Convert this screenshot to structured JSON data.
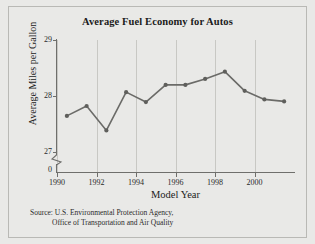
{
  "figure": {
    "title": "Average Fuel Economy for Autos",
    "background_color": "#e9e9e7",
    "line_color": "#6b6b68",
    "grid_color": "#c8c8c4",
    "axis_color": "#6f6f6c"
  },
  "axes": {
    "x_title": "Model Year",
    "y_title": "Average Miles per Gallon",
    "y_ticks": [
      "0",
      "27",
      "28",
      "29"
    ],
    "x_ticks": [
      "1990",
      "1992",
      "1994",
      "1996",
      "1998",
      "2000"
    ],
    "y_axis_break": "zigzag between 0 and 27"
  },
  "source": {
    "line1": "Source: U.S. Environmental Protection Agency,",
    "line2": "Office of Transportation and Air Quality"
  },
  "chart_data": {
    "type": "line",
    "title": "Average Fuel Economy for Autos",
    "xlabel": "Model Year",
    "ylabel": "Average Miles per Gallon",
    "x": [
      1990,
      1991,
      1992,
      1993,
      1994,
      1995,
      1996,
      1997,
      1998,
      1999,
      2000,
      2001
    ],
    "values": [
      27.85,
      28.0,
      27.63,
      28.21,
      28.06,
      28.32,
      28.32,
      28.41,
      28.52,
      28.23,
      28.1,
      28.07
    ],
    "xlim": [
      1989.5,
      2001.5
    ],
    "ylim": [
      27.0,
      29.0
    ],
    "y_ticks": [
      0,
      27,
      28,
      29
    ],
    "x_ticks": [
      1990,
      1992,
      1994,
      1996,
      1998,
      2000
    ],
    "grid": "vertical gridlines at even years",
    "legend": "none",
    "markers": "filled circles",
    "annotations": [
      "y-axis broken between 0 and 27"
    ]
  }
}
